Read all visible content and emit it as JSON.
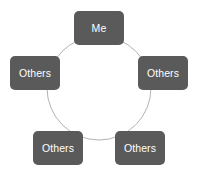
{
  "diagram": {
    "type": "cycle",
    "title": "",
    "background_color": "#ffffff",
    "node_fill_color": "#5a5a5a",
    "node_text_color": "#ffffff",
    "ring_stroke_color": "#b3b3b3",
    "nodes": [
      {
        "id": "top",
        "label": "Me",
        "position": "top"
      },
      {
        "id": "right",
        "label": "Others",
        "position": "right"
      },
      {
        "id": "bottomright",
        "label": "Others",
        "position": "bottom-right"
      },
      {
        "id": "bottomleft",
        "label": "Others",
        "position": "bottom-left"
      },
      {
        "id": "left",
        "label": "Others",
        "position": "left"
      }
    ]
  }
}
